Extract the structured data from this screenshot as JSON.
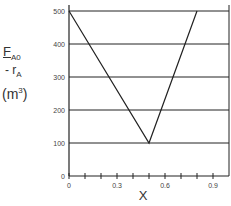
{
  "chart_data": {
    "type": "line",
    "title": "",
    "xlabel": "X",
    "ylabel": {
      "numerator": "F",
      "numerator_sub": "A0",
      "denominator": "- r",
      "denominator_sub": "A",
      "unit_base": "m",
      "unit_exp": "3"
    },
    "xlim": [
      0,
      1.0
    ],
    "ylim": [
      0,
      500
    ],
    "x_ticks": [
      0,
      0.1,
      0.2,
      0.3,
      0.4,
      0.5,
      0.6,
      0.7,
      0.8,
      0.9
    ],
    "x_tick_labels": [
      {
        "value": 0,
        "label": "0"
      },
      {
        "value": 0.3,
        "label": "0.3"
      },
      {
        "value": 0.6,
        "label": "0.6"
      },
      {
        "value": 0.9,
        "label": "0.9"
      }
    ],
    "y_ticks": [
      0,
      100,
      200,
      300,
      400,
      500
    ],
    "y_tick_labels": [
      "0",
      "100",
      "200",
      "300",
      "400",
      "500"
    ],
    "grid": "horizontal",
    "series": [
      {
        "name": "FA0/-rA",
        "x": [
          0,
          0.5,
          0.8
        ],
        "y": [
          500,
          100,
          500
        ]
      }
    ],
    "colors": {
      "line": "#222222",
      "grid": "#222222",
      "axis": "#222222"
    }
  }
}
